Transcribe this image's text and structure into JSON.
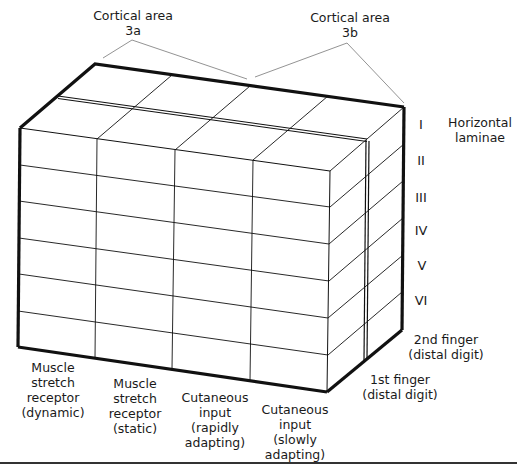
{
  "diagram": {
    "title_labels": {
      "area_3a": "Cortical area\n3a",
      "area_3b": "Cortical area\n3b",
      "horizontal_laminae": "Horizontal\nlaminae"
    },
    "laminae": [
      "I",
      "II",
      "III",
      "IV",
      "V",
      "VI"
    ],
    "columns": [
      "Muscle\nstretch\nreceptor\n(dynamic)",
      "Muscle\nstretch\nreceptor\n(static)",
      "Cutaneous\ninput\n(rapidly\nadapting)",
      "Cutaneous\ninput\n(slowly\nadapting)"
    ],
    "depth_labels": {
      "second_finger": "2nd finger\n(distal digit)",
      "first_finger": "1st finger\n(distal digit)"
    },
    "colors": {
      "line": "#111111",
      "thin_line": "#333333",
      "background": "#ffffff"
    }
  }
}
